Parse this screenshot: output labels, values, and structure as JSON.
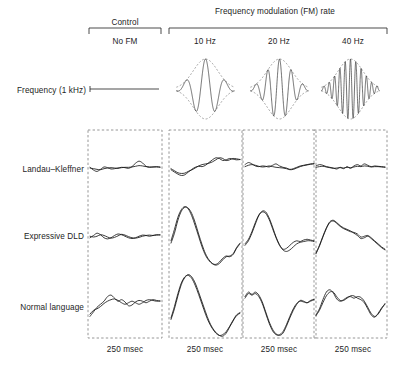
{
  "figure": {
    "header": {
      "control_group_label": "Control",
      "fm_group_label": "Frequency modulation (FM) rate"
    },
    "columns": [
      {
        "key": "no_fm",
        "label": "No FM",
        "group": "Control",
        "duration_label": "250 msec",
        "fm_hz": 0
      },
      {
        "key": "hz10",
        "label": "10 Hz",
        "group": "FM",
        "duration_label": "250 msec",
        "fm_hz": 10
      },
      {
        "key": "hz20",
        "label": "20 Hz",
        "group": "FM",
        "duration_label": "250 msec",
        "fm_hz": 20
      },
      {
        "key": "hz40",
        "label": "40 Hz",
        "group": "FM",
        "duration_label": "250 msec",
        "fm_hz": 40
      }
    ],
    "rows": [
      {
        "key": "stimulus",
        "label": "Frequency (1 kHz)"
      },
      {
        "key": "landau",
        "label": "Landau–Kleffner"
      },
      {
        "key": "expressive_dld",
        "label": "Expressive DLD"
      },
      {
        "key": "normal",
        "label": "Normal language"
      }
    ],
    "colors": {
      "trace": "#1a1a1a",
      "panel_border": "#8a8a8a",
      "envelope": "#6b6b6b",
      "background": "#ffffff"
    }
  },
  "chart_data": {
    "type": "line",
    "title": "",
    "subtitle": "",
    "xlabel": "250 msec",
    "ylabel": "",
    "grid": false,
    "legend": "none",
    "x_range": [
      0,
      250
    ],
    "x_units": "msec",
    "y_units": "microvolts (arbitrary scale)",
    "y_range": [
      -1,
      1
    ],
    "stimuli": [
      {
        "column": "no_fm",
        "kind": "flat-line",
        "fm_hz": 0,
        "carrier_khz": 1,
        "envelope": false,
        "cycles": 0
      },
      {
        "column": "hz10",
        "kind": "gaussian-fm-burst",
        "fm_hz": 10,
        "carrier_khz": 1,
        "envelope": true,
        "cycles": 3
      },
      {
        "column": "hz20",
        "kind": "gaussian-fm-burst",
        "fm_hz": 20,
        "carrier_khz": 1,
        "envelope": true,
        "cycles": 5
      },
      {
        "column": "hz40",
        "kind": "gaussian-fm-burst",
        "fm_hz": 40,
        "carrier_khz": 1,
        "envelope": true,
        "cycles": 11
      }
    ],
    "series": [
      {
        "name": "Landau–Kleffner / No FM",
        "row": "landau",
        "column": "no_fm",
        "repetitions": 2,
        "values_a": [
          0.02,
          -0.06,
          -0.1,
          -0.04,
          0.03,
          0.01,
          -0.03,
          -0.02,
          0.0,
          0.02,
          0.01,
          -0.01,
          0.04,
          0.14,
          0.2,
          0.15,
          0.05,
          0.02,
          0.03,
          0.04,
          0.03
        ],
        "values_b": [
          0.0,
          -0.02,
          -0.04,
          -0.05,
          -0.02,
          0.0,
          0.01,
          0.0,
          -0.01,
          0.01,
          0.02,
          0.02,
          0.03,
          0.05,
          0.07,
          0.06,
          0.04,
          0.03,
          0.03,
          0.03,
          0.02
        ]
      },
      {
        "name": "Landau–Kleffner / 10 Hz",
        "row": "landau",
        "column": "hz10",
        "repetitions": 2,
        "values_a": [
          -0.05,
          -0.12,
          -0.18,
          -0.22,
          -0.2,
          -0.12,
          -0.04,
          0.02,
          0.05,
          0.04,
          0.08,
          0.16,
          0.24,
          0.3,
          0.28,
          0.22,
          0.24,
          0.28,
          0.26,
          0.24,
          0.25
        ],
        "values_b": [
          -0.02,
          -0.08,
          -0.14,
          -0.16,
          -0.15,
          -0.1,
          -0.06,
          0.0,
          0.06,
          0.1,
          0.12,
          0.14,
          0.18,
          0.24,
          0.3,
          0.28,
          0.22,
          0.24,
          0.28,
          0.27,
          0.25
        ]
      },
      {
        "name": "Landau–Kleffner / 20 Hz",
        "row": "landau",
        "column": "hz20",
        "repetitions": 2,
        "values_a": [
          0.1,
          0.16,
          0.12,
          0.06,
          0.04,
          0.06,
          0.05,
          0.03,
          0.08,
          0.12,
          0.06,
          0.02,
          0.0,
          -0.04,
          -0.02,
          0.02,
          0.06,
          0.08,
          0.1,
          0.12,
          0.13
        ],
        "values_b": [
          0.04,
          0.08,
          0.1,
          0.08,
          0.05,
          0.03,
          0.04,
          0.06,
          0.04,
          0.02,
          0.01,
          0.0,
          -0.02,
          -0.05,
          -0.04,
          0.0,
          0.04,
          0.07,
          0.09,
          0.11,
          0.12
        ]
      },
      {
        "name": "Landau–Kleffner / 40 Hz",
        "row": "landau",
        "column": "hz40",
        "repetitions": 2,
        "values_a": [
          0.06,
          0.1,
          0.08,
          0.04,
          0.02,
          0.0,
          -0.03,
          0.02,
          -0.02,
          0.04,
          -0.01,
          0.06,
          0.1,
          0.06,
          0.12,
          0.08,
          0.04,
          0.06,
          0.05,
          0.04,
          0.03
        ],
        "values_b": [
          0.02,
          0.04,
          0.05,
          0.03,
          0.01,
          -0.01,
          0.0,
          0.01,
          0.0,
          0.02,
          0.01,
          0.03,
          0.05,
          0.04,
          0.06,
          0.05,
          0.03,
          0.04,
          0.04,
          0.03,
          0.02
        ]
      },
      {
        "name": "Expressive DLD / No FM",
        "row": "expressive_dld",
        "column": "no_fm",
        "repetitions": 2,
        "values_a": [
          -0.02,
          0.04,
          0.1,
          0.06,
          -0.02,
          -0.05,
          -0.02,
          0.04,
          0.08,
          0.06,
          0.02,
          -0.02,
          -0.04,
          -0.02,
          0.02,
          0.05,
          0.04,
          0.02,
          0.04,
          0.06,
          0.05
        ],
        "values_b": [
          0.02,
          0.0,
          0.02,
          0.06,
          0.04,
          0.0,
          -0.03,
          -0.01,
          0.03,
          0.07,
          0.05,
          0.01,
          -0.02,
          -0.03,
          -0.01,
          0.02,
          0.04,
          0.05,
          0.04,
          0.05,
          0.06
        ]
      },
      {
        "name": "Expressive DLD / 10 Hz",
        "row": "expressive_dld",
        "column": "hz10",
        "repetitions": 2,
        "values_a": [
          -0.1,
          0.2,
          0.52,
          0.72,
          0.8,
          0.74,
          0.56,
          0.3,
          0.02,
          -0.26,
          -0.48,
          -0.62,
          -0.7,
          -0.72,
          -0.66,
          -0.56,
          -0.5,
          -0.52,
          -0.46,
          -0.3,
          -0.18
        ],
        "values_b": [
          -0.16,
          0.1,
          0.44,
          0.68,
          0.78,
          0.76,
          0.62,
          0.38,
          0.08,
          -0.2,
          -0.44,
          -0.6,
          -0.7,
          -0.74,
          -0.7,
          -0.6,
          -0.52,
          -0.5,
          -0.44,
          -0.28,
          -0.16
        ]
      },
      {
        "name": "Expressive DLD / 20 Hz",
        "row": "expressive_dld",
        "column": "hz20",
        "repetitions": 2,
        "values_a": [
          -0.18,
          -0.06,
          0.14,
          0.38,
          0.58,
          0.66,
          0.62,
          0.46,
          0.22,
          -0.02,
          -0.22,
          -0.32,
          -0.3,
          -0.22,
          -0.14,
          -0.1,
          -0.12,
          -0.08,
          -0.06,
          -0.08,
          -0.1
        ],
        "values_b": [
          -0.22,
          -0.1,
          0.1,
          0.34,
          0.56,
          0.68,
          0.66,
          0.5,
          0.26,
          0.0,
          -0.2,
          -0.34,
          -0.38,
          -0.34,
          -0.26,
          -0.18,
          -0.14,
          -0.12,
          -0.1,
          -0.1,
          -0.12
        ]
      },
      {
        "name": "Expressive DLD / 40 Hz",
        "row": "expressive_dld",
        "column": "hz40",
        "repetitions": 2,
        "values_a": [
          -0.42,
          -0.22,
          0.02,
          0.24,
          0.4,
          0.44,
          0.38,
          0.3,
          0.24,
          0.2,
          0.16,
          0.1,
          0.04,
          -0.04,
          -0.02,
          0.02,
          -0.04,
          -0.12,
          -0.2,
          -0.28,
          -0.34
        ],
        "values_b": [
          -0.44,
          -0.24,
          0.0,
          0.22,
          0.38,
          0.42,
          0.36,
          0.28,
          0.22,
          0.18,
          0.14,
          0.12,
          0.08,
          0.0,
          0.02,
          0.04,
          -0.02,
          -0.1,
          -0.18,
          -0.26,
          -0.32
        ]
      },
      {
        "name": "Normal language / No FM",
        "row": "normal",
        "column": "no_fm",
        "repetitions": 2,
        "values_a": [
          -0.3,
          -0.18,
          -0.06,
          0.02,
          0.1,
          0.22,
          0.26,
          0.18,
          0.1,
          0.14,
          0.08,
          -0.02,
          0.0,
          0.08,
          0.12,
          0.1,
          0.06,
          0.1,
          0.14,
          0.12,
          0.1
        ],
        "values_b": [
          -0.24,
          -0.14,
          -0.1,
          -0.04,
          0.04,
          0.1,
          0.14,
          0.16,
          0.12,
          0.06,
          0.02,
          0.06,
          0.1,
          0.06,
          0.02,
          0.06,
          0.12,
          0.14,
          0.12,
          0.1,
          0.11
        ]
      },
      {
        "name": "Normal language / 10 Hz",
        "row": "normal",
        "column": "hz10",
        "repetitions": 2,
        "values_a": [
          -0.34,
          -0.04,
          0.3,
          0.58,
          0.74,
          0.78,
          0.7,
          0.52,
          0.28,
          0.02,
          -0.24,
          -0.46,
          -0.62,
          -0.74,
          -0.8,
          -0.78,
          -0.7,
          -0.56,
          -0.4,
          -0.26,
          -0.2
        ],
        "values_b": [
          -0.38,
          -0.1,
          0.24,
          0.54,
          0.72,
          0.8,
          0.74,
          0.58,
          0.34,
          0.08,
          -0.18,
          -0.42,
          -0.6,
          -0.72,
          -0.8,
          -0.82,
          -0.74,
          -0.58,
          -0.42,
          -0.28,
          -0.22
        ]
      },
      {
        "name": "Normal language / 20 Hz",
        "row": "normal",
        "column": "hz20",
        "repetitions": 2,
        "values_a": [
          0.22,
          0.34,
          0.28,
          0.34,
          0.26,
          0.08,
          -0.18,
          -0.44,
          -0.64,
          -0.76,
          -0.8,
          -0.74,
          -0.56,
          -0.34,
          -0.14,
          0.02,
          0.12,
          0.1,
          0.06,
          0.1,
          0.14
        ],
        "values_b": [
          0.18,
          0.3,
          0.26,
          0.3,
          0.22,
          0.04,
          -0.22,
          -0.48,
          -0.68,
          -0.78,
          -0.78,
          -0.7,
          -0.52,
          -0.3,
          -0.1,
          0.04,
          0.1,
          0.08,
          0.06,
          0.12,
          0.15
        ]
      },
      {
        "name": "Normal language / 40 Hz",
        "row": "normal",
        "column": "hz40",
        "repetitions": 2,
        "values_a": [
          -0.26,
          -0.1,
          0.14,
          0.34,
          0.4,
          0.32,
          0.16,
          0.1,
          0.14,
          0.2,
          0.22,
          0.18,
          0.22,
          0.2,
          0.1,
          -0.06,
          -0.22,
          -0.3,
          -0.24,
          -0.1,
          0.04
        ],
        "values_b": [
          -0.28,
          -0.14,
          0.06,
          0.24,
          0.34,
          0.34,
          0.22,
          0.12,
          0.12,
          0.18,
          0.24,
          0.24,
          0.18,
          0.14,
          0.06,
          -0.1,
          -0.26,
          -0.32,
          -0.22,
          -0.08,
          0.02
        ]
      }
    ]
  }
}
